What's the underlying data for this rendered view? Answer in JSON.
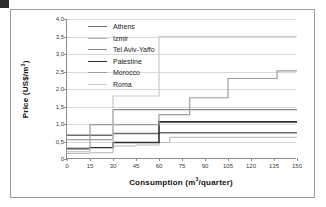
{
  "figure": {
    "marker": "",
    "xlabel_main": "Consumption (m",
    "xlabel_sup": "3",
    "xlabel_tail": "/quarter)",
    "ylabel_main": "Price (US$/m",
    "ylabel_sup": "3",
    "ylabel_tail": ")"
  },
  "chart_data": {
    "type": "line",
    "title": "",
    "xlabel": "Consumption (m3/quarter)",
    "ylabel": "Price (US$/m3)",
    "xlim": [
      0,
      150
    ],
    "ylim": [
      0,
      4.0
    ],
    "xticks": [
      "0",
      "15",
      "30",
      "45",
      "60",
      "75",
      "90",
      "105",
      "120",
      "135",
      "150"
    ],
    "xtick_values": [
      0,
      15,
      30,
      45,
      60,
      75,
      90,
      105,
      120,
      135,
      150
    ],
    "yticks": [
      "0",
      "0,5",
      "1,0",
      "1,5",
      "2,0",
      "2,5",
      "3,0",
      "3,5",
      "4,0"
    ],
    "ytick_values": [
      0,
      0.5,
      1.0,
      1.5,
      2.0,
      2.5,
      3.0,
      3.5,
      4.0
    ],
    "grid": "horizontal",
    "legend_position": "upper-left-inside",
    "step_style": "post",
    "series": [
      {
        "name": "Athens",
        "color": "#6e6e6e",
        "width": 1.5,
        "x": [
          0,
          15,
          30,
          60,
          150
        ],
        "values": [
          0.68,
          0.68,
          0.73,
          0.75,
          0.75
        ]
      },
      {
        "name": "Izmir",
        "color": "#b6b6b6",
        "width": 1.0,
        "x": [
          0,
          15,
          30,
          45,
          60,
          67,
          150
        ],
        "values": [
          0.16,
          0.18,
          0.37,
          0.4,
          0.47,
          0.62,
          0.62
        ]
      },
      {
        "name": "Tel Aviv-Yaffo",
        "color": "#8a8a8a",
        "width": 1.2,
        "x": [
          0,
          15,
          30,
          150
        ],
        "values": [
          0.55,
          0.55,
          1.41,
          1.41
        ]
      },
      {
        "name": "Palestine",
        "color": "#2e2e2e",
        "width": 1.6,
        "x": [
          0,
          15,
          30,
          60,
          150
        ],
        "values": [
          0.3,
          0.32,
          0.47,
          1.06,
          1.06
        ]
      },
      {
        "name": "Morocco",
        "color": "#9c9c9c",
        "width": 1.2,
        "x": [
          0,
          15,
          30,
          60,
          80,
          105,
          137,
          150
        ],
        "values": [
          0.28,
          0.98,
          0.98,
          1.27,
          1.75,
          2.3,
          2.52,
          2.52
        ]
      },
      {
        "name": "Roma",
        "color": "#c9c9c9",
        "width": 1.2,
        "x": [
          0,
          15,
          30,
          60,
          137,
          150
        ],
        "values": [
          0.21,
          0.3,
          1.8,
          3.5,
          3.5,
          3.5
        ]
      }
    ]
  }
}
